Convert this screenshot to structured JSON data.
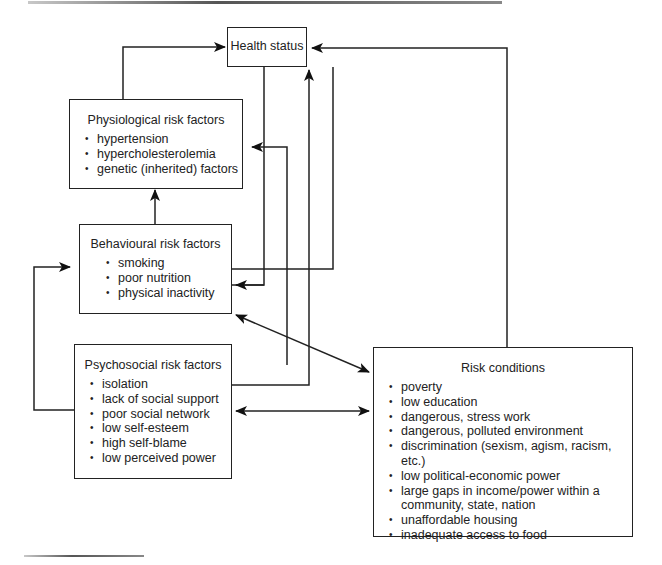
{
  "diagram": {
    "nodes": {
      "health_status": {
        "title": "Health status"
      },
      "physiological": {
        "title": "Physiological risk factors",
        "items": [
          "hypertension",
          "hypercholesterolemia",
          "genetic (inherited) factors"
        ]
      },
      "behavioural": {
        "title": "Behavioural risk factors",
        "items": [
          "smoking",
          "poor nutrition",
          "physical inactivity"
        ]
      },
      "psychosocial": {
        "title": "Psychosocial risk factors",
        "items": [
          "isolation",
          "lack of social support",
          "poor social network",
          "low self-esteem",
          "high self-blame",
          "low perceived power"
        ]
      },
      "risk_conditions": {
        "title": "Risk conditions",
        "items": [
          "poverty",
          "low education",
          "dangerous, stress work",
          "dangerous, polluted environment",
          "discrimination (sexism, agism, racism, etc.)",
          "low political-economic power",
          "large gaps in income/power within a community, state, nation",
          "unaffordable housing",
          "inadequate access to food"
        ]
      }
    },
    "edges": [
      {
        "from": "physiological",
        "to": "health_status",
        "type": "one-way"
      },
      {
        "from": "risk_conditions",
        "to": "health_status",
        "type": "one-way"
      },
      {
        "from": "psychosocial",
        "to": "health_status",
        "type": "one-way"
      },
      {
        "from": "behavioural",
        "to": "physiological",
        "type": "one-way"
      },
      {
        "from": "behavioural",
        "to": "health_status",
        "type": "one-way"
      },
      {
        "from": "health_status",
        "to": "psychosocial",
        "type": "one-way"
      },
      {
        "from": "psychosocial",
        "to": "behavioural",
        "type": "one-way"
      },
      {
        "from": "behavioural",
        "to": "risk_conditions",
        "type": "two-way"
      },
      {
        "from": "psychosocial",
        "to": "risk_conditions",
        "type": "two-way"
      }
    ]
  }
}
